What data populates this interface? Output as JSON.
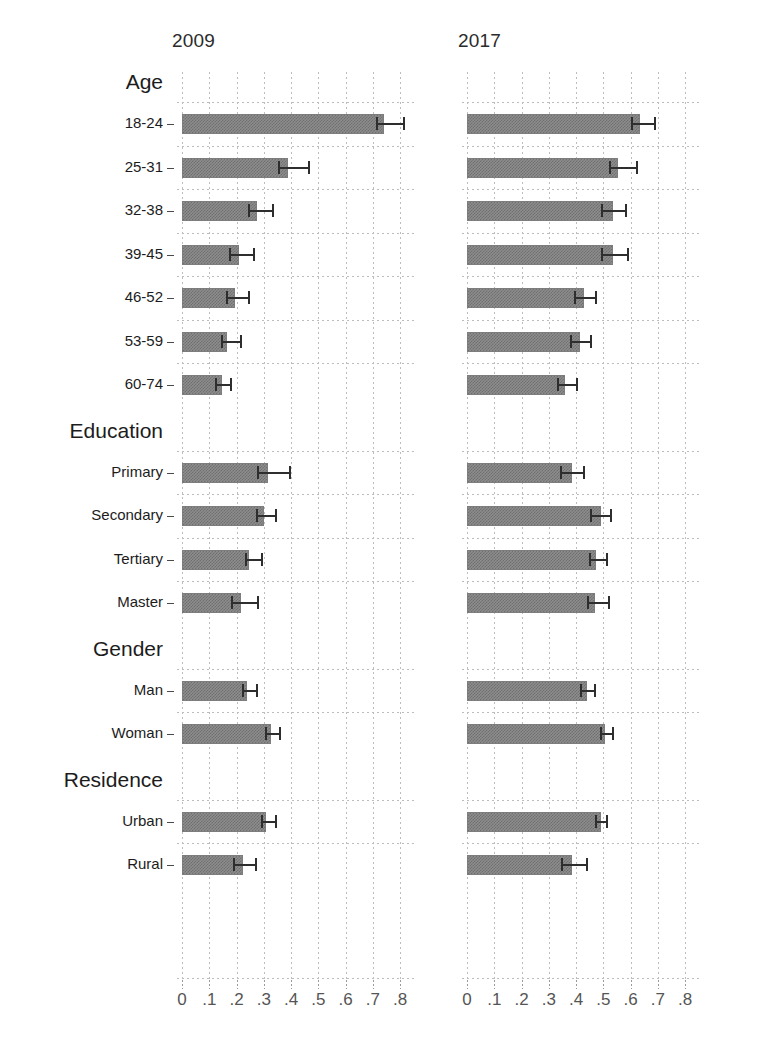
{
  "figure": {
    "width": 769,
    "height": 1043,
    "background": "#ffffff",
    "bar_color": "#8d8d8d",
    "error_color": "#2e2e2e",
    "grid_color": "#bdbdbd"
  },
  "chart_data": {
    "type": "bar",
    "orientation": "horizontal",
    "title": "",
    "xlabel": "",
    "ylabel": "",
    "xlim": [
      0,
      0.85
    ],
    "grid": true,
    "legend": "none",
    "error_bars": "95% confidence interval",
    "panels": [
      {
        "label": "2009"
      },
      {
        "label": "2017"
      }
    ],
    "xticks": [
      0,
      0.1,
      0.2,
      0.3,
      0.4,
      0.5,
      0.6,
      0.7,
      0.8
    ],
    "xticklabels": [
      "0",
      ".1",
      ".2",
      ".3",
      ".4",
      ".5",
      ".6",
      ".7",
      ".8"
    ],
    "groups": [
      {
        "name": "Age",
        "categories": [
          "18-24",
          "25-31",
          "32-38",
          "39-45",
          "46-52",
          "53-59",
          "60-74"
        ],
        "series": [
          {
            "name": "2009",
            "values": [
              0.74,
              0.39,
              0.275,
              0.21,
              0.195,
              0.165,
              0.145
            ],
            "ci_low": [
              0.715,
              0.355,
              0.245,
              0.175,
              0.165,
              0.145,
              0.125
            ],
            "ci_high": [
              0.815,
              0.465,
              0.335,
              0.265,
              0.245,
              0.215,
              0.18
            ]
          },
          {
            "name": "2017",
            "values": [
              0.635,
              0.555,
              0.535,
              0.535,
              0.43,
              0.415,
              0.36
            ],
            "ci_low": [
              0.605,
              0.525,
              0.495,
              0.495,
              0.395,
              0.38,
              0.335
            ],
            "ci_high": [
              0.69,
              0.625,
              0.585,
              0.59,
              0.475,
              0.455,
              0.405
            ]
          }
        ]
      },
      {
        "name": "Education",
        "categories": [
          "Primary",
          "Secondary",
          "Tertiary",
          "Master"
        ],
        "series": [
          {
            "name": "2009",
            "values": [
              0.315,
              0.3,
              0.245,
              0.215
            ],
            "ci_low": [
              0.28,
              0.275,
              0.235,
              0.185
            ],
            "ci_high": [
              0.395,
              0.345,
              0.295,
              0.28
            ]
          },
          {
            "name": "2017",
            "values": [
              0.385,
              0.49,
              0.475,
              0.47
            ],
            "ci_low": [
              0.345,
              0.455,
              0.45,
              0.445
            ],
            "ci_high": [
              0.43,
              0.53,
              0.515,
              0.52
            ]
          }
        ]
      },
      {
        "name": "Gender",
        "categories": [
          "Man",
          "Woman"
        ],
        "series": [
          {
            "name": "2009",
            "values": [
              0.24,
              0.325
            ],
            "ci_low": [
              0.225,
              0.31
            ],
            "ci_high": [
              0.275,
              0.36
            ]
          },
          {
            "name": "2017",
            "values": [
              0.44,
              0.505
            ],
            "ci_low": [
              0.42,
              0.49
            ],
            "ci_high": [
              0.47,
              0.535
            ]
          }
        ]
      },
      {
        "name": "Residence",
        "categories": [
          "Urban",
          "Rural"
        ],
        "series": [
          {
            "name": "2009",
            "values": [
              0.31,
              0.225
            ],
            "ci_low": [
              0.295,
              0.19
            ],
            "ci_high": [
              0.345,
              0.27
            ]
          },
          {
            "name": "2017",
            "values": [
              0.49,
              0.385
            ],
            "ci_low": [
              0.475,
              0.35
            ],
            "ci_high": [
              0.515,
              0.44
            ]
          }
        ]
      }
    ]
  }
}
